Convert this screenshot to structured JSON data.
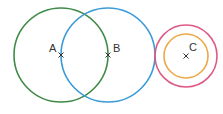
{
  "diagram": {
    "circles": [
      {
        "name": "circle-a",
        "center": "A",
        "cx": 61,
        "cy": 55,
        "r": 47,
        "color": "#3f8a47"
      },
      {
        "name": "circle-b",
        "center": "B",
        "cx": 108,
        "cy": 55,
        "r": 47,
        "color": "#3a9ad8"
      },
      {
        "name": "circle-c-outer",
        "center": "C",
        "cx": 186,
        "cy": 56,
        "r": 31,
        "color": "#de5a85"
      },
      {
        "name": "circle-c-inner",
        "center": "C",
        "cx": 186,
        "cy": 56,
        "r": 22,
        "color": "#eea84a"
      }
    ],
    "points": [
      {
        "label": "A",
        "x": 61,
        "y": 55
      },
      {
        "label": "B",
        "x": 108,
        "y": 55
      },
      {
        "label": "C",
        "x": 186,
        "y": 56
      }
    ]
  }
}
